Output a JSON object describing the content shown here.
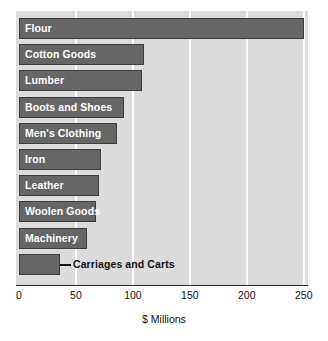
{
  "chart_data": {
    "type": "bar",
    "orientation": "horizontal",
    "title": "",
    "xlabel": "$ Millions",
    "ylabel": "",
    "xlim": [
      0,
      260
    ],
    "xticks": [
      0,
      50,
      100,
      150,
      200,
      250
    ],
    "xtick_labels": [
      "0",
      "50",
      "100",
      "150",
      "200",
      "250"
    ],
    "grid": "vertical",
    "legend": "none",
    "categories": [
      "Flour",
      "Cotton Goods",
      "Lumber",
      "Boots and Shoes",
      "Men's Clothing",
      "Iron",
      "Leather",
      "Woolen Goods",
      "Machinery",
      "Carriages and Carts"
    ],
    "values": [
      250,
      110,
      108,
      92,
      86,
      72,
      70,
      68,
      60,
      36
    ],
    "label_placement": [
      "inside",
      "inside",
      "inside",
      "inside",
      "inside",
      "inside",
      "inside",
      "inside",
      "inside",
      "outside"
    ],
    "colors": {
      "bar_fill": "#666666",
      "bar_border": "#3c3c3c",
      "plot_background": "#dcdcdc",
      "gridline": "#fcfcfc",
      "axis_line": "#2a2a2a",
      "inside_label_text": "#ffffff",
      "outside_label_text": "#111111",
      "page_background": "#ffffff"
    }
  }
}
